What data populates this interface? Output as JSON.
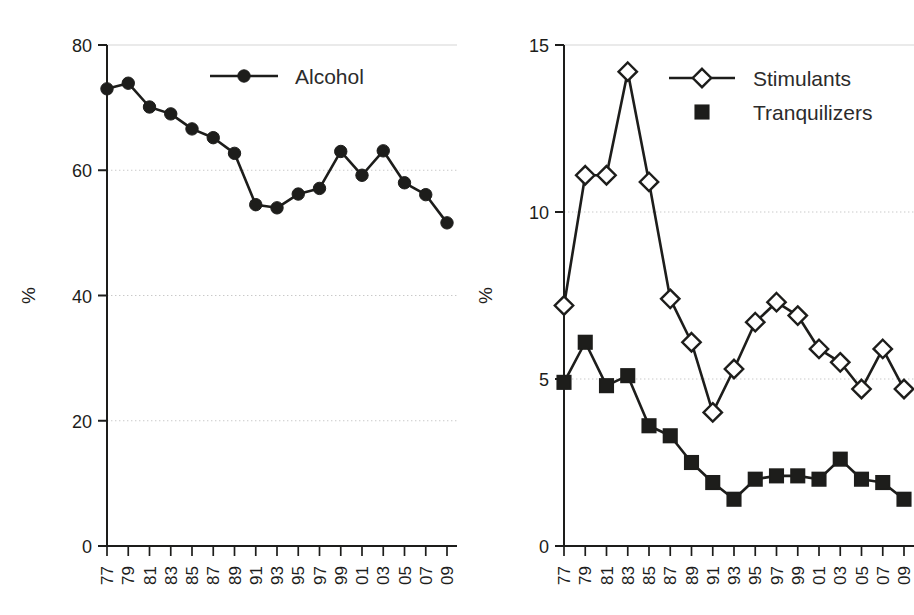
{
  "figure": {
    "background_color": "#ffffff",
    "ink_color": "#1d1d1b",
    "grid_color": "#c9c9c9",
    "panel_count": 2
  },
  "chart_data": [
    {
      "type": "line",
      "title": "",
      "subtitle": "",
      "xlabel": "",
      "ylabel": "%",
      "xlim": [
        1977,
        2009
      ],
      "ylim": [
        0,
        80
      ],
      "yticks": [
        0,
        20,
        40,
        60,
        80
      ],
      "ytick_labels": [
        "0",
        "20",
        "40",
        "60",
        "80"
      ],
      "x": [
        1977,
        1979,
        1981,
        1983,
        1985,
        1987,
        1989,
        1991,
        1993,
        1995,
        1997,
        1999,
        2001,
        2003,
        2005,
        2007,
        2009
      ],
      "xtick_labels": [
        "77",
        "79",
        "81",
        "83",
        "85",
        "87",
        "89",
        "91",
        "93",
        "95",
        "97",
        "99",
        "01",
        "03",
        "05",
        "07",
        "09"
      ],
      "grid": "horizontal-dotted",
      "legend_position": "top-center",
      "series": [
        {
          "name": "Alcohol",
          "marker": "filled-circle",
          "color": "#1d1d1b",
          "values": [
            73.0,
            73.9,
            70.1,
            69.0,
            66.6,
            65.2,
            62.7,
            54.5,
            54.0,
            56.2,
            57.1,
            63.0,
            59.2,
            63.1,
            58.0,
            56.1,
            51.6
          ]
        }
      ]
    },
    {
      "type": "line",
      "title": "",
      "subtitle": "",
      "xlabel": "",
      "ylabel": "%",
      "xlim": [
        1977,
        2009
      ],
      "ylim": [
        0,
        15
      ],
      "yticks": [
        0,
        5,
        10,
        15
      ],
      "ytick_labels": [
        "0",
        "5",
        "10",
        "15"
      ],
      "x": [
        1977,
        1979,
        1981,
        1983,
        1985,
        1987,
        1989,
        1991,
        1993,
        1995,
        1997,
        1999,
        2001,
        2003,
        2005,
        2007,
        2009
      ],
      "xtick_labels": [
        "77",
        "79",
        "81",
        "83",
        "85",
        "87",
        "89",
        "91",
        "93",
        "95",
        "97",
        "99",
        "01",
        "03",
        "05",
        "07",
        "09"
      ],
      "grid": "horizontal-dotted",
      "legend_position": "top-right",
      "series": [
        {
          "name": "Stimulants",
          "marker": "open-diamond",
          "color": "#1d1d1b",
          "values": [
            7.2,
            11.1,
            11.1,
            14.2,
            10.9,
            7.4,
            6.1,
            4.0,
            5.3,
            6.7,
            7.3,
            6.9,
            5.9,
            5.5,
            4.7,
            5.9,
            4.7
          ]
        },
        {
          "name": "Tranquilizers",
          "marker": "filled-square",
          "color": "#1d1d1b",
          "values": [
            4.9,
            6.1,
            4.8,
            5.1,
            3.6,
            3.3,
            2.5,
            1.9,
            1.4,
            2.0,
            2.1,
            2.1,
            2.0,
            2.6,
            2.0,
            1.9,
            1.4
          ]
        }
      ]
    }
  ],
  "left_panel": {
    "y_axis_title": "%",
    "legend": {
      "entries": [
        {
          "label": "Alcohol",
          "marker": "filled-circle"
        }
      ]
    }
  },
  "right_panel": {
    "y_axis_title": "%",
    "legend": {
      "entries": [
        {
          "label": "Stimulants",
          "marker": "open-diamond"
        },
        {
          "label": "Tranquilizers",
          "marker": "filled-square"
        }
      ]
    }
  }
}
